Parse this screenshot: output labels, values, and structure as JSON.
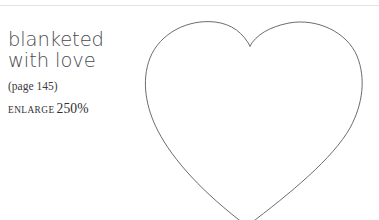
{
  "page": {
    "background_color": "#ffffff",
    "rule_color": "#e2e2e4"
  },
  "caption": {
    "title_lines": [
      "blanketed",
      "with love"
    ],
    "title_color": "#4b4b4d",
    "page_reference": "(page 145)",
    "enlarge_label": "ENLARGE",
    "enlarge_value": "250%"
  },
  "figure": {
    "shape_name": "heart-outline",
    "stroke_color": "#5b5b60",
    "stroke_width": "0.9",
    "fill": "none",
    "note": "heart outline template, cropped at bottom edge of page"
  }
}
